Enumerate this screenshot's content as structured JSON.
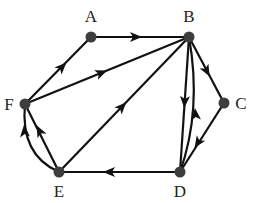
{
  "diagram": {
    "type": "directed-graph",
    "colors": {
      "edge": "#111111",
      "node": "#3d3d3d",
      "label": "#222222",
      "background": "#ffffff"
    },
    "nodes": [
      {
        "id": "A",
        "label": "A",
        "x": 91,
        "y": 37,
        "lx": 91,
        "ly": 22
      },
      {
        "id": "B",
        "label": "B",
        "x": 189,
        "y": 37,
        "lx": 189,
        "ly": 22
      },
      {
        "id": "C",
        "label": "C",
        "x": 224,
        "y": 103,
        "lx": 241,
        "ly": 109
      },
      {
        "id": "D",
        "label": "D",
        "x": 180,
        "y": 172,
        "lx": 180,
        "ly": 197
      },
      {
        "id": "E",
        "label": "E",
        "x": 59,
        "y": 172,
        "lx": 59,
        "ly": 197
      },
      {
        "id": "F",
        "label": "F",
        "x": 25,
        "y": 104,
        "lx": 9,
        "ly": 110
      }
    ],
    "edges": [
      {
        "from": "A",
        "to": "B",
        "shape": "straight"
      },
      {
        "from": "F",
        "to": "A",
        "shape": "straight"
      },
      {
        "from": "F",
        "to": "B",
        "shape": "straight"
      },
      {
        "from": "E",
        "to": "B",
        "shape": "straight"
      },
      {
        "from": "B",
        "to": "C",
        "shape": "straight"
      },
      {
        "from": "C",
        "to": "D",
        "shape": "straight"
      },
      {
        "from": "B",
        "to": "D",
        "shape": "straight"
      },
      {
        "from": "D",
        "to": "B",
        "shape": "curved"
      },
      {
        "from": "D",
        "to": "E",
        "shape": "straight"
      },
      {
        "from": "E",
        "to": "F",
        "shape": "straight"
      },
      {
        "from": "E",
        "to": "F",
        "shape": "curved"
      }
    ]
  }
}
